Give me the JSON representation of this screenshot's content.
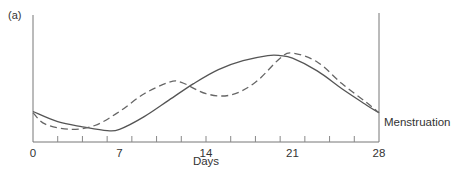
{
  "panel_label": "(a)",
  "chart_data": {
    "type": "line",
    "title": "",
    "panel": "(a)",
    "xlabel": "Days",
    "ylabel": "",
    "xlim": [
      0,
      28
    ],
    "xticks_labeled": [
      0,
      7,
      14,
      21,
      28
    ],
    "xtick_labels": [
      "0",
      "7",
      "14",
      "21",
      "28"
    ],
    "minor_ticks_every": 2,
    "grid": false,
    "annotations": [
      {
        "text": "Menstruation",
        "x": 28,
        "position": "right of end point"
      }
    ],
    "series": [
      {
        "name": "solid",
        "style": "solid",
        "x": [
          0,
          2,
          4,
          6,
          7,
          9,
          11,
          13,
          15,
          17,
          19,
          20,
          21,
          23,
          25,
          27,
          28
        ],
        "y": [
          0.24,
          0.16,
          0.12,
          0.09,
          0.1,
          0.2,
          0.33,
          0.46,
          0.57,
          0.64,
          0.68,
          0.68,
          0.66,
          0.56,
          0.42,
          0.29,
          0.23
        ]
      },
      {
        "name": "dashed",
        "style": "dashed",
        "x": [
          0,
          1,
          3,
          5,
          7,
          9,
          11,
          12,
          14,
          16,
          18,
          20,
          21,
          23,
          25,
          27,
          28
        ],
        "y": [
          0.23,
          0.14,
          0.1,
          0.13,
          0.24,
          0.38,
          0.47,
          0.47,
          0.38,
          0.37,
          0.47,
          0.66,
          0.7,
          0.63,
          0.46,
          0.31,
          0.23
        ]
      }
    ]
  }
}
